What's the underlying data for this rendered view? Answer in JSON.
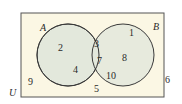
{
  "diagram": {
    "type": "venn",
    "universe_label": "U",
    "sets": [
      {
        "label": "A"
      },
      {
        "label": "B"
      }
    ],
    "regions": {
      "a_only": [
        "2",
        "4"
      ],
      "a_and_b": [
        "3",
        "7"
      ],
      "b_only": [
        "1",
        "8",
        "10"
      ],
      "outside": [
        "9",
        "5",
        "6"
      ]
    },
    "colors": {
      "universe_fill": "#fbf7e4",
      "circle_fill": "#e3e8dc",
      "stroke": "#3a3a3a"
    }
  }
}
